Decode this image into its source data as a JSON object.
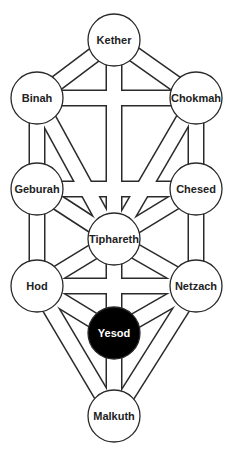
{
  "diagram": {
    "colors": {
      "line": "#2a2a2a",
      "fill": "#ffffff",
      "highlight": "#000000",
      "highlight_text": "#ffffff"
    },
    "node_radius": 26,
    "channel_width": 15,
    "nodes": [
      {
        "id": "kether",
        "label": "Kether",
        "x": 114,
        "y": 40
      },
      {
        "id": "binah",
        "label": "Binah",
        "x": 37,
        "y": 98
      },
      {
        "id": "chokmah",
        "label": "Chokmah",
        "x": 196,
        "y": 98
      },
      {
        "id": "geburah",
        "label": "Geburah",
        "x": 37,
        "y": 189
      },
      {
        "id": "chesed",
        "label": "Chesed",
        "x": 196,
        "y": 189
      },
      {
        "id": "tiphareth",
        "label": "Tiphareth",
        "x": 114,
        "y": 239
      },
      {
        "id": "hod",
        "label": "Hod",
        "x": 37,
        "y": 286
      },
      {
        "id": "netzach",
        "label": "Netzach",
        "x": 196,
        "y": 286
      },
      {
        "id": "yesod",
        "label": "Yesod",
        "x": 114,
        "y": 333,
        "highlighted": true
      },
      {
        "id": "malkuth",
        "label": "Malkuth",
        "x": 114,
        "y": 416
      }
    ],
    "paths": [
      [
        "kether",
        "binah"
      ],
      [
        "kether",
        "chokmah"
      ],
      [
        "kether",
        "tiphareth"
      ],
      [
        "binah",
        "chokmah"
      ],
      [
        "binah",
        "geburah"
      ],
      [
        "binah",
        "tiphareth"
      ],
      [
        "chokmah",
        "chesed"
      ],
      [
        "chokmah",
        "tiphareth"
      ],
      [
        "geburah",
        "chesed"
      ],
      [
        "geburah",
        "tiphareth"
      ],
      [
        "geburah",
        "hod"
      ],
      [
        "chesed",
        "tiphareth"
      ],
      [
        "chesed",
        "netzach"
      ],
      [
        "tiphareth",
        "hod"
      ],
      [
        "tiphareth",
        "netzach"
      ],
      [
        "tiphareth",
        "yesod"
      ],
      [
        "hod",
        "netzach"
      ],
      [
        "hod",
        "yesod"
      ],
      [
        "hod",
        "malkuth"
      ],
      [
        "netzach",
        "yesod"
      ],
      [
        "netzach",
        "malkuth"
      ],
      [
        "yesod",
        "malkuth"
      ]
    ]
  }
}
